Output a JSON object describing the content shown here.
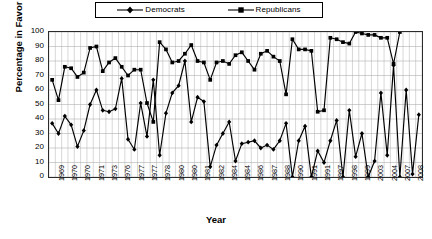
{
  "legend": {
    "items": [
      {
        "label": "Democrats",
        "marker": "diamond-marker-icon",
        "color": "#000000"
      },
      {
        "label": "Republicans",
        "marker": "square-marker-icon",
        "color": "#000000"
      }
    ]
  },
  "axes": {
    "ylabel": "Percentage in Favor",
    "xlabel": "Year",
    "yticks": [
      "0",
      "10",
      "20",
      "30",
      "40",
      "50",
      "60",
      "70",
      "80",
      "90",
      "100"
    ]
  },
  "caption": "",
  "chart_data": {
    "type": "line",
    "title": "",
    "xlabel": "Year",
    "ylabel": "Percentage in Favor",
    "ylim": [
      0,
      100
    ],
    "ytick_step": 10,
    "grid": true,
    "legend_position": "top",
    "x_tick_labels": [
      "1969",
      "1970",
      "1970",
      "1971",
      "1973",
      "1976",
      "1977",
      "1977",
      "1978",
      "1980",
      "1980",
      "1981",
      "1982",
      "1984",
      "1984",
      "1986",
      "1987",
      "1988",
      "1990",
      "1991",
      "1991",
      "1997",
      "1998",
      "1999",
      "2003",
      "2004",
      "2007",
      "2008"
    ],
    "n_points": 56,
    "series": [
      {
        "name": "Democrats",
        "marker": "diamond",
        "values": [
          37,
          30,
          42,
          36,
          21,
          32,
          50,
          60,
          46,
          45,
          47,
          68,
          26,
          19,
          51,
          28,
          67,
          15,
          44,
          58,
          63,
          80,
          38,
          55,
          52,
          7,
          22,
          30,
          38,
          11,
          23,
          24,
          25,
          20,
          22,
          19,
          25,
          37,
          0,
          25,
          35,
          0,
          18,
          10,
          25,
          39,
          0,
          46,
          14,
          30,
          0,
          11,
          58,
          15,
          77,
          0,
          60,
          2,
          43
        ]
      },
      {
        "name": "Republicans",
        "marker": "square",
        "values": [
          67,
          53,
          76,
          75,
          69,
          72,
          89,
          90,
          73,
          79,
          82,
          76,
          70,
          74,
          74,
          51,
          38,
          93,
          88,
          79,
          80,
          85,
          91,
          80,
          79,
          67,
          79,
          80,
          78,
          84,
          86,
          80,
          74,
          85,
          87,
          83,
          80,
          57,
          95,
          88,
          88,
          87,
          45,
          46,
          96,
          95,
          93,
          92,
          100,
          99,
          98,
          98,
          96,
          96,
          78,
          100
        ]
      }
    ]
  }
}
